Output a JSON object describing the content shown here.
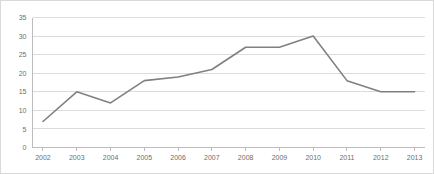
{
  "chart_data": {
    "type": "line",
    "title": "",
    "subtitle": "",
    "xlabel": "",
    "ylabel": "",
    "categories": [
      "2002",
      "2003",
      "2004",
      "2005",
      "2006",
      "2007",
      "2008",
      "2009",
      "2010",
      "2011",
      "2012",
      "2013"
    ],
    "values": [
      7,
      15,
      12,
      18,
      19,
      21,
      27,
      27,
      30,
      18,
      15,
      15
    ],
    "series": [
      {
        "name": "",
        "values": [
          7,
          15,
          12,
          18,
          19,
          21,
          27,
          27,
          30,
          18,
          15,
          15
        ]
      }
    ],
    "ylim": [
      0,
      35
    ],
    "ytick_values": [
      0,
      5,
      10,
      15,
      20,
      25,
      30,
      35
    ],
    "ytick_labels": [
      "0",
      "5",
      "10",
      "15",
      "20",
      "25",
      "30",
      "35"
    ],
    "xtick_labels": [
      "2002",
      "2003",
      "2004",
      "2005",
      "2006",
      "2007",
      "2008",
      "2009",
      "2010",
      "2011",
      "2012",
      "2013"
    ],
    "grid": true,
    "grid_axis": "y",
    "legend": false,
    "legend_position": "none",
    "annotations": [],
    "colors": {
      "line": "#808080",
      "gridline": "#dcdcdc",
      "axis": "#bdbdbd",
      "tick_label": "#6e6e6e",
      "background": "#ffffff",
      "border": "#d9d9d9"
    }
  }
}
